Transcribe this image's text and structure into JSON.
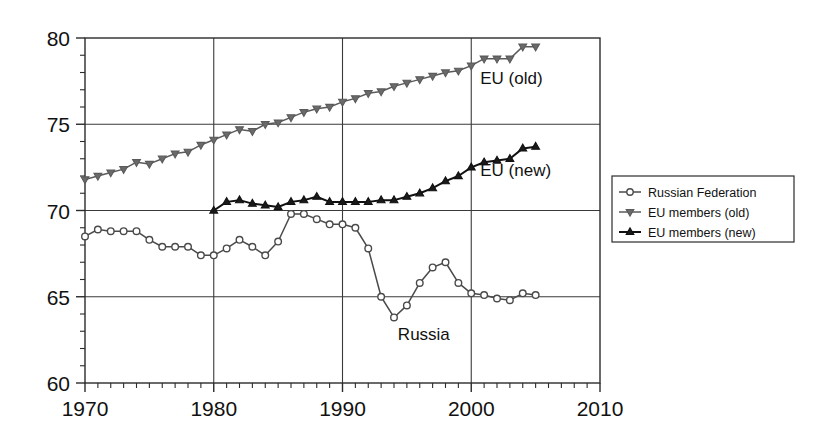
{
  "chart_data": {
    "type": "line",
    "title": "",
    "subtitle": "",
    "xlabel": "",
    "ylabel": "",
    "xlim": [
      1970,
      2010
    ],
    "ylim": [
      60,
      80
    ],
    "x_ticks": [
      1970,
      1980,
      1990,
      2000,
      2010
    ],
    "x_tick_labels": [
      "1970",
      "1980",
      "1990",
      "2000",
      "2010"
    ],
    "x_minor_tick_step": 1,
    "y_ticks": [
      60,
      65,
      70,
      75,
      80
    ],
    "y_tick_labels": [
      "60",
      "65",
      "70",
      "75",
      "80"
    ],
    "y_minor_tick_step": 1,
    "grid": "major-xy",
    "legend_position": "right-outside",
    "annotations": [
      {
        "text": "EU (old)",
        "x": 2000.7,
        "y": 77.35
      },
      {
        "text": "EU (new)",
        "x": 2000.7,
        "y": 72.0
      },
      {
        "text": "Russia",
        "x": 1994.3,
        "y": 62.5
      }
    ],
    "series": [
      {
        "name": "Russian Federation",
        "marker": "circle",
        "color": "#4a4a4a",
        "x": [
          1970,
          1971,
          1972,
          1973,
          1974,
          1975,
          1976,
          1977,
          1978,
          1979,
          1980,
          1981,
          1982,
          1983,
          1984,
          1985,
          1986,
          1987,
          1988,
          1989,
          1990,
          1991,
          1992,
          1993,
          1994,
          1995,
          1996,
          1997,
          1998,
          1999,
          2000,
          2001,
          2002,
          2003,
          2004,
          2005
        ],
        "values": [
          68.5,
          68.9,
          68.8,
          68.8,
          68.8,
          68.3,
          67.9,
          67.9,
          67.9,
          67.4,
          67.4,
          67.8,
          68.3,
          67.9,
          67.4,
          68.2,
          69.8,
          69.8,
          69.5,
          69.2,
          69.2,
          69.0,
          67.8,
          65.0,
          63.8,
          64.5,
          65.8,
          66.7,
          67.0,
          65.8,
          65.2,
          65.1,
          64.9,
          64.8,
          65.2,
          65.1
        ]
      },
      {
        "name": "EU members (old)",
        "marker": "triangle-down",
        "color": "#5a5a5a",
        "x": [
          1970,
          1971,
          1972,
          1973,
          1974,
          1975,
          1976,
          1977,
          1978,
          1979,
          1980,
          1981,
          1982,
          1983,
          1984,
          1985,
          1986,
          1987,
          1988,
          1989,
          1990,
          1991,
          1992,
          1993,
          1994,
          1995,
          1996,
          1997,
          1998,
          1999,
          2000,
          2001,
          2002,
          2003,
          2004,
          2005
        ],
        "values": [
          71.8,
          72.0,
          72.2,
          72.4,
          72.8,
          72.7,
          73.0,
          73.3,
          73.4,
          73.8,
          74.1,
          74.4,
          74.7,
          74.6,
          75.0,
          75.1,
          75.4,
          75.7,
          75.9,
          76.0,
          76.3,
          76.5,
          76.8,
          76.9,
          77.2,
          77.4,
          77.6,
          77.8,
          78.0,
          78.1,
          78.4,
          78.8,
          78.8,
          78.8,
          79.5,
          79.5
        ]
      },
      {
        "name": "EU members (new)",
        "marker": "triangle-up",
        "color": "#111111",
        "x": [
          1980,
          1981,
          1982,
          1983,
          1984,
          1985,
          1986,
          1987,
          1988,
          1989,
          1990,
          1991,
          1992,
          1993,
          1994,
          1995,
          1996,
          1997,
          1998,
          1999,
          2000,
          2001,
          2002,
          2003,
          2004,
          2005
        ],
        "values": [
          70.0,
          70.5,
          70.6,
          70.4,
          70.3,
          70.2,
          70.5,
          70.6,
          70.8,
          70.5,
          70.5,
          70.5,
          70.5,
          70.6,
          70.6,
          70.8,
          71.0,
          71.3,
          71.7,
          72.0,
          72.5,
          72.8,
          72.9,
          73.0,
          73.6,
          73.7
        ]
      }
    ]
  },
  "legend": {
    "items": [
      {
        "label": "Russian Federation",
        "marker": "circle"
      },
      {
        "label": "EU members (old)",
        "marker": "triangle-down"
      },
      {
        "label": "EU members (new)",
        "marker": "triangle-up"
      }
    ]
  }
}
